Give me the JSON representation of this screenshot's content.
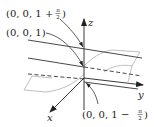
{
  "diagram": {
    "title": "",
    "axes": {
      "x_label": "x",
      "y_label": "y",
      "z_label": "z"
    },
    "points": [
      {
        "id": "top",
        "label_prefix": "(0, 0, 1 + ",
        "label_frac_num": "π",
        "label_frac_den": "2",
        "label_suffix": ")"
      },
      {
        "id": "mid",
        "label": "(0, 0, 1)"
      },
      {
        "id": "bottom",
        "label_prefix": "(0, 0, 1 − ",
        "label_frac_num": "π",
        "label_frac_den": "2",
        "label_suffix": ")"
      }
    ],
    "colors": {
      "line": "#333333",
      "surface": "#b8b8b8"
    }
  }
}
